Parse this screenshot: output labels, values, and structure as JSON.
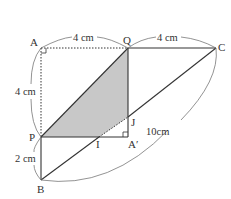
{
  "diagram": {
    "points": {
      "A": "A",
      "Q": "Q",
      "C": "C",
      "P": "P",
      "I": "I",
      "J": "J",
      "A_prime": "A′",
      "B": "B"
    },
    "dimensions": {
      "AQ": "4 cm",
      "QC": "4 cm",
      "AP": "4 cm",
      "PB": "2 cm",
      "BC": "10cm"
    },
    "colors": {
      "shaded": "#c8c8c8",
      "line": "#333333",
      "arc": "#777777"
    }
  }
}
